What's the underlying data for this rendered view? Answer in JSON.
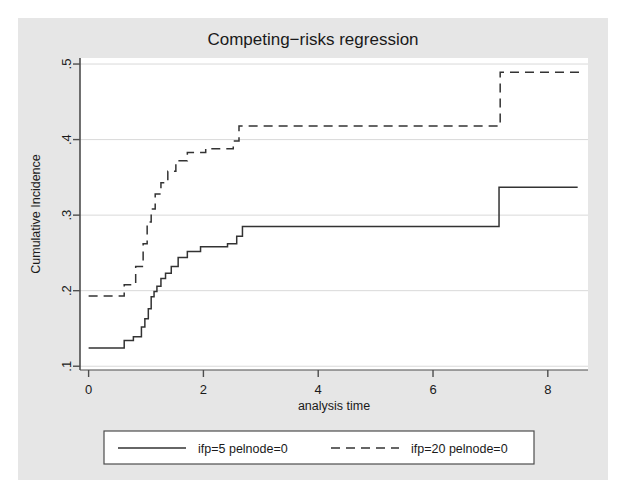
{
  "chart_data": {
    "type": "line",
    "subtype": "step",
    "title": "Competing−risks regression",
    "xlabel": "analysis time",
    "ylabel": "Cumulative Incidence",
    "xlim": [
      -0.15,
      8.7
    ],
    "ylim": [
      0.095,
      0.508
    ],
    "xticks": [
      "0",
      "2",
      "4",
      "6",
      "8"
    ],
    "xtick_values": [
      0,
      2,
      4,
      6,
      8
    ],
    "yticks": [
      ".1",
      ".2",
      ".3",
      ".4",
      ".5"
    ],
    "ytick_values": [
      0.1,
      0.2,
      0.3,
      0.4,
      0.5
    ],
    "grid": "horizontal",
    "legend_position": "bottom",
    "plot_bgcolor": "#ffffff",
    "figure_bgcolor": "#e6e6e6",
    "line_color": "#333333",
    "series": [
      {
        "name": "ifp=5 pelnode=0",
        "style": "solid",
        "x": [
          0.0,
          0.62,
          0.62,
          0.78,
          0.78,
          0.92,
          0.92,
          0.98,
          0.98,
          1.04,
          1.04,
          1.09,
          1.09,
          1.14,
          1.14,
          1.19,
          1.19,
          1.26,
          1.26,
          1.34,
          1.34,
          1.44,
          1.44,
          1.56,
          1.56,
          1.72,
          1.72,
          1.95,
          1.95,
          2.42,
          2.42,
          2.58,
          2.58,
          2.68,
          2.68,
          7.15,
          7.15,
          8.52
        ],
        "y": [
          0.124,
          0.124,
          0.134,
          0.134,
          0.139,
          0.139,
          0.152,
          0.152,
          0.163,
          0.163,
          0.176,
          0.176,
          0.192,
          0.192,
          0.199,
          0.199,
          0.206,
          0.206,
          0.216,
          0.216,
          0.223,
          0.223,
          0.232,
          0.232,
          0.244,
          0.244,
          0.252,
          0.252,
          0.258,
          0.258,
          0.262,
          0.262,
          0.272,
          0.272,
          0.285,
          0.285,
          0.337,
          0.337
        ]
      },
      {
        "name": "ifp=20 pelnode=0",
        "style": "dashed",
        "x": [
          0.0,
          0.62,
          0.62,
          0.82,
          0.82,
          0.95,
          0.95,
          1.02,
          1.02,
          1.09,
          1.09,
          1.16,
          1.16,
          1.26,
          1.26,
          1.38,
          1.38,
          1.52,
          1.52,
          1.72,
          1.72,
          2.04,
          2.04,
          2.52,
          2.52,
          2.62,
          2.62,
          7.17,
          7.17,
          8.6
        ],
        "y": [
          0.193,
          0.193,
          0.208,
          0.208,
          0.232,
          0.232,
          0.262,
          0.262,
          0.291,
          0.291,
          0.308,
          0.308,
          0.328,
          0.328,
          0.343,
          0.343,
          0.358,
          0.358,
          0.372,
          0.372,
          0.383,
          0.383,
          0.388,
          0.388,
          0.398,
          0.398,
          0.418,
          0.418,
          0.489,
          0.489
        ]
      }
    ]
  },
  "legend": {
    "entries": [
      {
        "label": "ifp=5 pelnode=0",
        "style": "solid"
      },
      {
        "label": "ifp=20 pelnode=0",
        "style": "dashed"
      }
    ]
  }
}
